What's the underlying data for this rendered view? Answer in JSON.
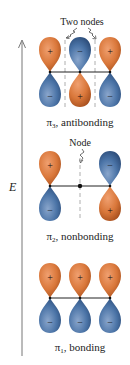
{
  "axis": {
    "label": "E",
    "direction": "up"
  },
  "colors": {
    "positive_lobe": "#d9773a",
    "negative_lobe": "#4a73a6",
    "line": "#222222",
    "node_dash": "#999999"
  },
  "orbitals": [
    {
      "name": "pi3",
      "symbol": "π",
      "subscript": "3",
      "suffix": ", antibonding",
      "annotation": "Two nodes",
      "top_signs": [
        "+",
        "−",
        "+"
      ],
      "bottom_signs": [
        "−",
        "+",
        "−"
      ]
    },
    {
      "name": "pi2",
      "symbol": "π",
      "subscript": "2",
      "suffix": ", nonbonding",
      "annotation": "Node",
      "top_signs": [
        "+",
        "",
        "−"
      ],
      "bottom_signs": [
        "−",
        "",
        "+"
      ]
    },
    {
      "name": "pi1",
      "symbol": "π",
      "subscript": "1",
      "suffix": ", bonding",
      "annotation": "",
      "top_signs": [
        "+",
        "+",
        "+"
      ],
      "bottom_signs": [
        "−",
        "−",
        "−"
      ]
    }
  ]
}
